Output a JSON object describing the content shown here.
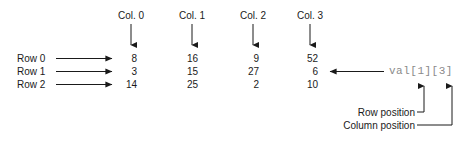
{
  "figure": {
    "colors": {
      "text": "#1a1a1a",
      "arrow": "#1a1a1a",
      "reference_text": "#8a8a8a",
      "background": "#ffffff"
    }
  },
  "column_headers": [
    {
      "label": "Col. 0",
      "x": 131
    },
    {
      "label": "Col. 1",
      "x": 192
    },
    {
      "label": "Col. 2",
      "x": 253
    },
    {
      "label": "Col. 3",
      "x": 310
    }
  ],
  "row_labels": [
    {
      "label": "Row 0",
      "y": 60
    },
    {
      "label": "Row 1",
      "y": 73
    },
    {
      "label": "Row 2",
      "y": 86
    }
  ],
  "grid": {
    "values": [
      [
        "8",
        "16",
        "9",
        "52"
      ],
      [
        "3",
        "15",
        "27",
        "6"
      ],
      [
        "14",
        "25",
        "2",
        "10"
      ]
    ],
    "column_right_edges": [
      137,
      198,
      259,
      318
    ],
    "row_baselines": [
      60,
      73,
      86
    ]
  },
  "reference": {
    "expression": "val[1][3]",
    "points_to_value": "6"
  },
  "annotations": [
    {
      "label": "Row position",
      "target": "row-index",
      "y": 113
    },
    {
      "label": "Column position",
      "target": "column-index",
      "y": 126
    }
  ]
}
